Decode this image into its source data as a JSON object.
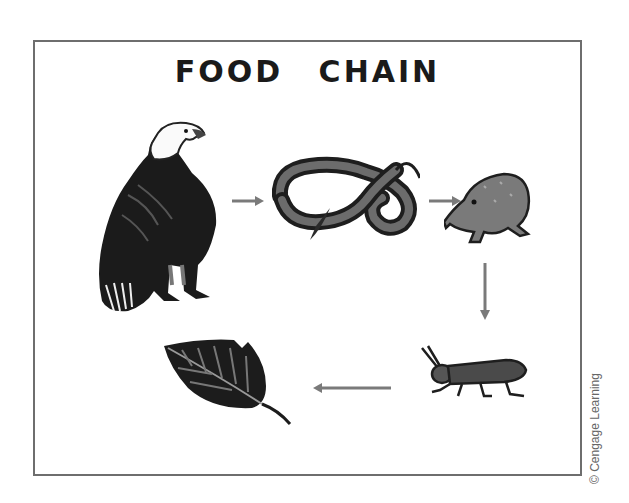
{
  "diagram": {
    "title": "FOOD CHAIN",
    "organisms": [
      {
        "id": "eagle",
        "name": "Eagle",
        "role": "tertiary consumer"
      },
      {
        "id": "snake",
        "name": "Snake",
        "role": "secondary consumer"
      },
      {
        "id": "frog",
        "name": "Frog",
        "role": "primary consumer (insectivore)"
      },
      {
        "id": "grasshopper",
        "name": "Grasshopper",
        "role": "primary consumer"
      },
      {
        "id": "leaf",
        "name": "Leaf",
        "role": "producer"
      }
    ],
    "arrows": [
      {
        "from": "eagle",
        "to": "snake",
        "direction": "right"
      },
      {
        "from": "snake",
        "to": "frog",
        "direction": "right"
      },
      {
        "from": "frog",
        "to": "grasshopper",
        "direction": "down"
      },
      {
        "from": "grasshopper",
        "to": "leaf",
        "direction": "left"
      }
    ],
    "colors": {
      "frame": "#6e6e6e",
      "arrow": "#7a7a7a",
      "ink": "#1a1a1a"
    }
  },
  "credit": "© Cengage Learning"
}
